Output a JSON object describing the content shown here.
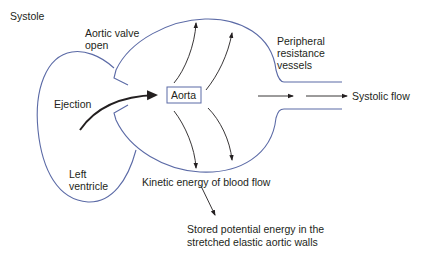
{
  "title": "Systole",
  "labels": {
    "valve": [
      "Aortic valve",
      "open"
    ],
    "ejection": "Ejection",
    "aorta": "Aorta",
    "peripheral": [
      "Peripheral",
      "resistance",
      "vessels"
    ],
    "systolic_flow": "Systolic flow",
    "ventricle": [
      "Left",
      "ventricle"
    ],
    "kinetic": "Kinetic energy of blood flow",
    "stored": [
      "Stored potential energy in the",
      "stretched elastic aortic walls"
    ]
  },
  "colors": {
    "outline": "#5b6aa6",
    "arrow": "#231f20",
    "text": "#231f20",
    "background": "#ffffff"
  }
}
